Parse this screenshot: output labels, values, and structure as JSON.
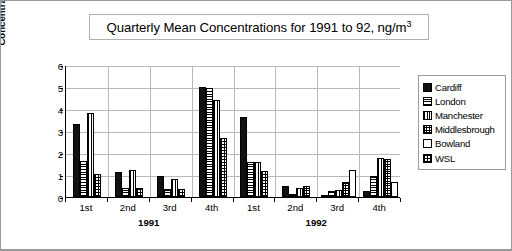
{
  "chart_data": {
    "type": "bar",
    "xlabel": "",
    "ylabel": "Concentration, ng/m³",
    "ylim": [
      0,
      6
    ],
    "yticks": [
      0,
      1,
      2,
      3,
      4,
      5,
      6
    ],
    "ytick_labels": [
      "0",
      "1",
      "2",
      "3",
      "4",
      "5",
      "6"
    ],
    "grid": true,
    "legend_position": "right",
    "categories": [
      "1st",
      "2nd",
      "3rd",
      "4th",
      "1st",
      "2nd",
      "3rd",
      "4th"
    ],
    "group_labels": [
      "1991",
      "1992"
    ],
    "series": [
      {
        "name": "Cardiff",
        "values": [
          3.3,
          1.12,
          0.97,
          5.02,
          3.63,
          0.48,
          0.07,
          0.28
        ]
      },
      {
        "name": "London",
        "values": [
          1.65,
          0.4,
          0.38,
          4.95,
          1.6,
          0.15,
          0.28,
          0.95
        ]
      },
      {
        "name": "Manchester",
        "values": [
          3.82,
          1.21,
          0.82,
          4.42,
          1.57,
          0.4,
          0.31,
          1.76
        ]
      },
      {
        "name": "Middlesbrough",
        "values": [
          0,
          0,
          0,
          0,
          0,
          0.52,
          0.68,
          1.73
        ]
      },
      {
        "name": "Bowland",
        "values": [
          0,
          0,
          0,
          0,
          0,
          0,
          1.25,
          0.7
        ]
      },
      {
        "name": "WSL",
        "values": [
          1.05,
          0.42,
          0.37,
          2.67,
          1.2,
          0,
          0,
          0
        ]
      }
    ]
  },
  "legend": {
    "items": [
      {
        "label": "Cardiff",
        "pattern": "solid-black",
        "color": "#111111"
      },
      {
        "label": "London",
        "pattern": "horizontal-lines",
        "color": "#000000"
      },
      {
        "label": "Manchester",
        "pattern": "vertical-lines",
        "color": "#000000"
      },
      {
        "label": "Middlesbrough",
        "pattern": "fine-crosshatch",
        "color": "#000000"
      },
      {
        "label": "Bowland",
        "pattern": "empty-white",
        "color": "#ffffff"
      },
      {
        "label": "WSL",
        "pattern": "coarse-checker",
        "color": "#000000"
      }
    ]
  },
  "axes": {
    "y_title": "Concentration, ng/m³",
    "y_ticks": [
      "0",
      "1",
      "2",
      "3",
      "4",
      "5",
      "6"
    ],
    "x_ticks": [
      "1st",
      "2nd",
      "3rd",
      "4th",
      "1st",
      "2nd",
      "3rd",
      "4th"
    ],
    "x_group_1": "1991",
    "x_group_2": "1992"
  }
}
